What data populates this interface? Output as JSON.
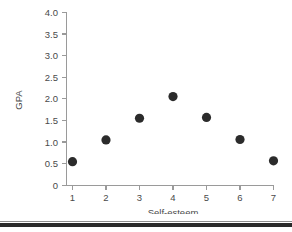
{
  "chart_data": {
    "type": "scatter",
    "title": "",
    "xlabel": "Self-esteem",
    "ylabel": "GPA",
    "x": [
      1,
      2,
      3,
      4,
      5,
      6,
      7
    ],
    "values": [
      0.55,
      1.05,
      1.55,
      2.05,
      1.57,
      1.06,
      0.57
    ],
    "series": [
      {
        "name": "GPA by Self-esteem",
        "points": [
          {
            "x": 1,
            "y": 0.55
          },
          {
            "x": 2,
            "y": 1.05
          },
          {
            "x": 3,
            "y": 1.55
          },
          {
            "x": 4,
            "y": 2.05
          },
          {
            "x": 5,
            "y": 1.57
          },
          {
            "x": 6,
            "y": 1.06
          },
          {
            "x": 7,
            "y": 0.57
          }
        ]
      }
    ],
    "xlim": [
      0.5,
      7.5
    ],
    "ylim": [
      0,
      4.0
    ],
    "x_ticks": [
      1,
      2,
      3,
      4,
      5,
      6,
      7
    ],
    "x_tick_labels": [
      "1",
      "2",
      "3",
      "4",
      "5",
      "6",
      "7"
    ],
    "y_ticks": [
      0,
      0.5,
      1.0,
      1.5,
      2.0,
      2.5,
      3.0,
      3.5,
      4.0
    ],
    "y_tick_labels": [
      "0",
      "0.5",
      "1.0",
      "1.5",
      "2.0",
      "2.5",
      "3.0",
      "3.5",
      "4.0"
    ],
    "grid": false,
    "legend": false,
    "marker": "filled-circle",
    "marker_color": "#2b2b2b",
    "axis_color": "#9a9a9a"
  },
  "axes": {
    "y_title": "GPA",
    "x_title": "Self-esteem"
  }
}
